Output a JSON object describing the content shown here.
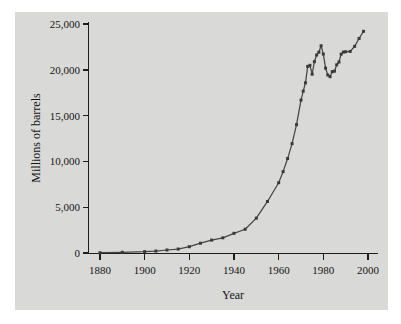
{
  "figure": {
    "panel_color": "#d9d9d7",
    "page_color": "#ffffff",
    "axis_color": "#1d1d1d",
    "series_color": "#454545",
    "marker_color": "#3a3a3a"
  },
  "chart_data": {
    "type": "line",
    "title": "",
    "xlabel": "Year",
    "ylabel": "Millions of barrels",
    "xlim": [
      1880,
      2000
    ],
    "ylim": [
      0,
      25000
    ],
    "xticks": [
      1880,
      1900,
      1920,
      1940,
      1960,
      1980,
      2000
    ],
    "xtick_labels": [
      "1880",
      "1900",
      "1920",
      "1940",
      "1960",
      "1980",
      "2000"
    ],
    "yticks": [
      0,
      5000,
      10000,
      15000,
      20000,
      25000
    ],
    "ytick_labels": [
      "0",
      "5,000",
      "10,000",
      "15,000",
      "20,000",
      "25,000"
    ],
    "grid": false,
    "legend": null,
    "marker": "square",
    "x": [
      1880,
      1890,
      1900,
      1905,
      1910,
      1915,
      1920,
      1925,
      1930,
      1935,
      1940,
      1945,
      1950,
      1955,
      1960,
      1962,
      1964,
      1966,
      1968,
      1970,
      1971,
      1972,
      1973,
      1974,
      1975,
      1976,
      1977,
      1978,
      1979,
      1980,
      1981,
      1982,
      1983,
      1984,
      1985,
      1986,
      1987,
      1988,
      1989,
      1990,
      1992,
      1994,
      1996,
      1998
    ],
    "values": [
      30,
      77,
      149,
      215,
      328,
      432,
      689,
      1069,
      1412,
      1655,
      2150,
      2595,
      3803,
      5626,
      7674,
      8882,
      10310,
      11940,
      14010,
      16690,
      17670,
      18580,
      20370,
      20490,
      19520,
      20890,
      21620,
      21920,
      22620,
      21720,
      20180,
      19430,
      19250,
      19800,
      19850,
      20550,
      20850,
      21710,
      21940,
      21970,
      22000,
      22560,
      23420,
      24200
    ]
  }
}
